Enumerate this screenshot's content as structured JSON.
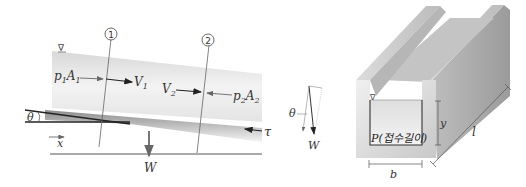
{
  "left_diagram": {
    "section_markers": [
      "1",
      "2"
    ],
    "free_surface_symbol": "∇",
    "labels": {
      "p1": "p",
      "p1_sub": "1",
      "A1": "A",
      "A1_sub": "1",
      "V1": "V",
      "V1_sub": "1",
      "V2": "V",
      "V2_sub": "2",
      "p2": "p",
      "p2_sub": "2",
      "A2": "A",
      "A2_sub": "2",
      "theta": "θ",
      "x": "x",
      "W": "W",
      "tau": "τ"
    }
  },
  "force_triangle": {
    "theta": "θ",
    "W": "W"
  },
  "right_diagram": {
    "free_surface_symbol": "∇",
    "wetted_perimeter": "P(접수길이)",
    "depth": "y",
    "width": "b",
    "length": "l"
  },
  "colors": {
    "water_light": "#f2f2f2",
    "water_dark": "#cfcfcf",
    "channel_light": "#e6e6e6",
    "channel_dark": "#a9a9a9",
    "line": "#333333"
  }
}
